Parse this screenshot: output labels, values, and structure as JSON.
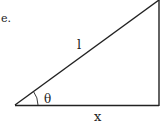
{
  "fragment_text": "e.",
  "triangle": {
    "hypotenuse_label": "l",
    "angle_label": "θ",
    "base_label": "x"
  },
  "colors": {
    "stroke": "#222222",
    "background": "#ffffff"
  }
}
